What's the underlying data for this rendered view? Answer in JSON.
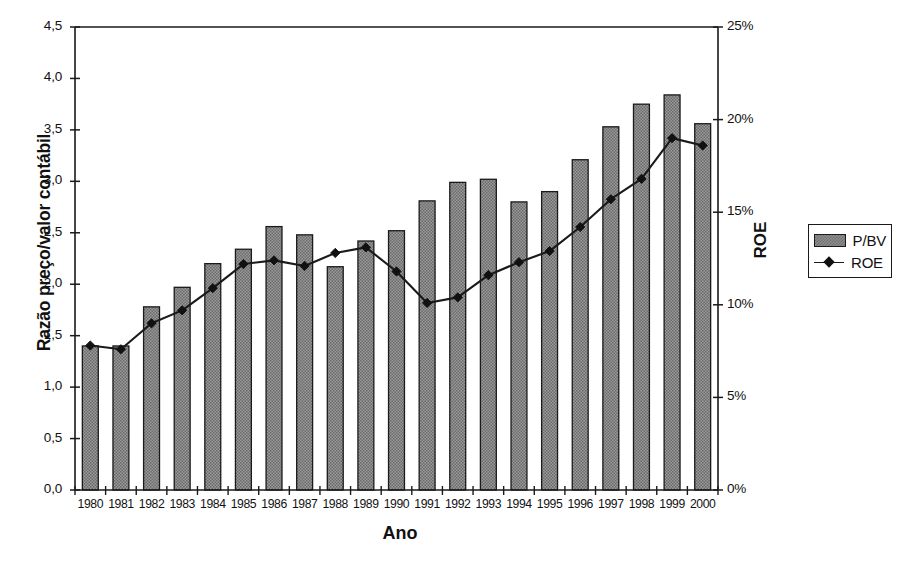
{
  "chart_data": {
    "type": "bar",
    "title": "",
    "xlabel": "Ano",
    "ylabel": "Razão preço/valor contábil",
    "y2label": "ROE",
    "grid": false,
    "legend_position": "right",
    "categories": [
      "1980",
      "1981",
      "1982",
      "1983",
      "1984",
      "1985",
      "1986",
      "1987",
      "1988",
      "1989",
      "1990",
      "1991",
      "1992",
      "1993",
      "1994",
      "1995",
      "1996",
      "1997",
      "1998",
      "1999",
      "2000"
    ],
    "ylim": [
      0,
      4.5
    ],
    "y2lim": [
      0,
      25
    ],
    "yticks": [
      "0,0",
      "0,5",
      "1,0",
      "1,5",
      "2,0",
      "2,5",
      "3,0",
      "3,5",
      "4,0",
      "4,5"
    ],
    "ytick_values": [
      0,
      0.5,
      1.0,
      1.5,
      2.0,
      2.5,
      3.0,
      3.5,
      4.0,
      4.5
    ],
    "y2ticks": [
      "0%",
      "5%",
      "10%",
      "15%",
      "20%",
      "25%"
    ],
    "y2tick_values": [
      0,
      5,
      10,
      15,
      20,
      25
    ],
    "series": [
      {
        "name": "P/BV",
        "kind": "bar",
        "axis": "left",
        "values": [
          1.4,
          1.4,
          1.78,
          1.97,
          2.2,
          2.34,
          2.56,
          2.48,
          2.17,
          2.42,
          2.52,
          2.81,
          2.99,
          3.02,
          2.8,
          2.9,
          3.21,
          3.53,
          3.75,
          3.84,
          3.56
        ]
      },
      {
        "name": "ROE",
        "kind": "line",
        "axis": "right",
        "values": [
          7.8,
          7.6,
          9.0,
          9.7,
          10.9,
          12.2,
          12.4,
          12.1,
          12.8,
          13.1,
          11.8,
          10.1,
          10.4,
          11.6,
          12.3,
          12.9,
          14.2,
          15.7,
          16.8,
          19.0,
          18.6
        ]
      }
    ],
    "legend": [
      {
        "label": "P/BV",
        "swatch": "bar-swatch"
      },
      {
        "label": "ROE",
        "swatch": "line-diamond-swatch"
      }
    ],
    "colors": {
      "bar_fill": "#8d8d8d",
      "bar_edge": "#1a1a1a",
      "line": "#1a1a1a",
      "marker": "#111111",
      "axis": "#1a1a1a",
      "background": "#ffffff"
    }
  }
}
